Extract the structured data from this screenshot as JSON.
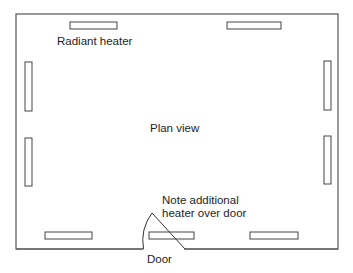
{
  "diagram": {
    "title": "Plan view",
    "labels": {
      "heater": "Radiant heater",
      "plan": "Plan view",
      "note_line1": "Note additional",
      "note_line2": "heater over door",
      "door": "Door"
    },
    "room": {
      "x": 16,
      "y": 14,
      "w": 322,
      "h": 235
    },
    "heaters": [
      {
        "id": "top-left",
        "x": 70,
        "y": 22,
        "w": 47,
        "h": 7
      },
      {
        "id": "top-right",
        "x": 227,
        "y": 22,
        "w": 54,
        "h": 7
      },
      {
        "id": "left-upper",
        "x": 25,
        "y": 62,
        "w": 7,
        "h": 49
      },
      {
        "id": "left-lower",
        "x": 25,
        "y": 138,
        "w": 7,
        "h": 48
      },
      {
        "id": "right-upper",
        "x": 324,
        "y": 61,
        "w": 7,
        "h": 49
      },
      {
        "id": "right-lower",
        "x": 324,
        "y": 136,
        "w": 7,
        "h": 48
      },
      {
        "id": "bottom-left",
        "x": 45,
        "y": 232,
        "w": 47,
        "h": 7
      },
      {
        "id": "bottom-door",
        "x": 149,
        "y": 232,
        "w": 45,
        "h": 7
      },
      {
        "id": "bottom-right",
        "x": 250,
        "y": 232,
        "w": 48,
        "h": 7
      }
    ],
    "colors": {
      "stroke": "#444444",
      "background": "#ffffff"
    }
  }
}
